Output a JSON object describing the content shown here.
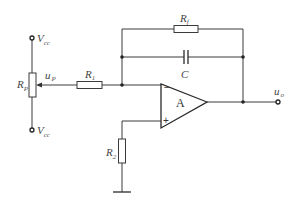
{
  "diagram": {
    "type": "op-amp integrator circuit with potentiometer input",
    "labels": {
      "vcc_top": {
        "main": "V",
        "sub": "cc"
      },
      "vcc_bottom": {
        "main": "V",
        "sub": "cc"
      },
      "rp": {
        "main": "R",
        "sub": "P"
      },
      "up": {
        "main": "u",
        "sub": "P"
      },
      "r1": {
        "main": "R",
        "sub": "1"
      },
      "rf": {
        "main": "R",
        "sub": "f"
      },
      "c": {
        "main": "C"
      },
      "r2": {
        "main": "R",
        "sub": "2"
      },
      "uo": {
        "main": "u",
        "sub": "o"
      },
      "opamp": "A",
      "minus": "−",
      "plus": "+"
    },
    "components": [
      "Vcc (top)",
      "Vcc (bottom)",
      "Rp (potentiometer)",
      "R1",
      "Rf",
      "C",
      "op-amp A",
      "R2",
      "ground",
      "uo output"
    ]
  }
}
